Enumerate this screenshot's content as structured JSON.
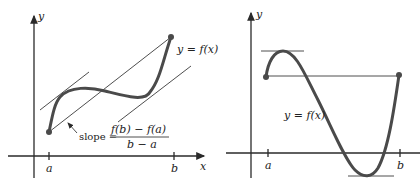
{
  "diagrams": [
    {
      "id": "left",
      "title": "Mean Value Theorem",
      "axes": {
        "x_label": "x",
        "y_label": "y"
      },
      "ticks": {
        "a": "a",
        "b": "b"
      },
      "curve_label": "y = f(x)",
      "annotation": {
        "prefix": "slope =",
        "numerator": "f(b) − f(a)",
        "denominator": "b − a"
      },
      "elements": [
        "secant line through endpoints",
        "two parallel tangent lines"
      ]
    },
    {
      "id": "right",
      "title": "Rolle's Theorem",
      "axes": {
        "y_label": "y"
      },
      "ticks": {
        "a": "a",
        "b": "b"
      },
      "curve_label": "y = f(x)",
      "elements": [
        "horizontal chord between endpoints f(a)=f(b)",
        "horizontal tangent at maximum",
        "horizontal tangent at minimum"
      ]
    }
  ],
  "colors": {
    "curve": "#4a4a4a",
    "lines": "#2a2a2a",
    "background": "#ffffff"
  }
}
